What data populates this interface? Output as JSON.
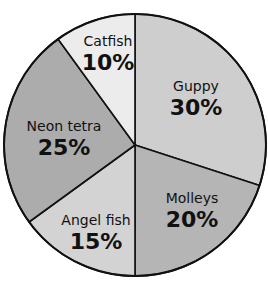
{
  "chart_data": {
    "type": "pie",
    "title": "",
    "start_angle_deg": 0,
    "direction": "clockwise",
    "categories": [
      "Guppy",
      "Molleys",
      "Angel fish",
      "Neon tetra",
      "Catfish"
    ],
    "values": [
      30,
      20,
      15,
      25,
      10
    ],
    "labels": [
      "30%",
      "20%",
      "15%",
      "25%",
      "10%"
    ],
    "colors": [
      "#cecece",
      "#b5b5b5",
      "#d3d3d3",
      "#acacac",
      "#ececec"
    ],
    "legend": "none",
    "label_position": "inside"
  },
  "geometry": {
    "cx": 135,
    "cy": 145,
    "r": 131
  },
  "slices": [
    {
      "name": "Guppy",
      "pct": "30%",
      "lx": 196,
      "ly": 91
    },
    {
      "name": "Molleys",
      "pct": "20%",
      "lx": 192,
      "ly": 203
    },
    {
      "name": "Angel fish",
      "pct": "15%",
      "lx": 96,
      "ly": 225
    },
    {
      "name": "Neon tetra",
      "pct": "25%",
      "lx": 64,
      "ly": 131
    },
    {
      "name": "Catfish",
      "pct": "10%",
      "lx": 108,
      "ly": 46
    }
  ]
}
